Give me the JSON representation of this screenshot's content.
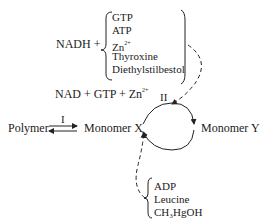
{
  "top_group": {
    "prefix": "NADH +",
    "items": [
      "GTP",
      "ATP",
      "Zn",
      "Thyroxine",
      "Diethylstilbestol"
    ],
    "zn_charge": "2+"
  },
  "products": {
    "text": "NAD + GTP + Zn",
    "charge": "2+"
  },
  "step_labels": {
    "step1": "I",
    "step2": "II"
  },
  "nodes": {
    "polymer": "Polymer",
    "monomer_x": "Monomer X",
    "monomer_y": "Monomer Y"
  },
  "bottom_group": {
    "items": [
      "ADP",
      "Leucine",
      "CH₃HgOH"
    ]
  },
  "colors": {
    "line": "#222222",
    "background": "#ffffff"
  }
}
